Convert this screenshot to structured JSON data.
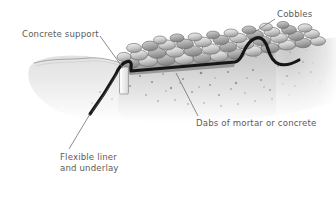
{
  "figure": {
    "type": "cross-section-illustration",
    "style": "pencil-and-wash grayscale technical illustration",
    "background_color": "#ffffff"
  },
  "labels": [
    {
      "id": "cobbles",
      "name": "label-cobbles",
      "text": "Cobbles",
      "lines": [
        "Cobbles"
      ],
      "x": 277,
      "y": 9,
      "color": "#5b5b5b",
      "leader": {
        "from": [
          275,
          19
        ],
        "to": [
          253,
          33
        ]
      }
    },
    {
      "id": "concrete-support",
      "name": "label-concrete-support",
      "text": "Concrete support",
      "lines": [
        "Concrete support"
      ],
      "x": 22,
      "y": 29,
      "color": "#5b5b5b",
      "leader": {
        "from": [
          100,
          36
        ],
        "to": [
          123,
          68
        ]
      }
    },
    {
      "id": "dabs",
      "name": "label-dabs-of-mortar-or-concrete",
      "text": "Dabs of mortar or concrete",
      "lines": [
        "Dabs of mortar or concrete"
      ],
      "x": 196,
      "y": 118,
      "color": "#5b5b5b",
      "leader": {
        "from": [
          198,
          117
        ],
        "to": [
          176,
          73
        ]
      }
    },
    {
      "id": "flexible-liner",
      "name": "label-flexible-liner-and-underlay",
      "text": "Flexible liner and underlay",
      "lines": [
        "Flexible liner",
        "and underlay"
      ],
      "x": 60,
      "y": 152,
      "color": "#5b5b5b",
      "leader": {
        "from": [
          69,
          150
        ],
        "to": [
          90,
          114
        ]
      }
    }
  ],
  "elements": {
    "ground_surface_line": {
      "name": "ground-surface-line",
      "color": "#9a9a9a"
    },
    "soil_mass": {
      "name": "soil-mass",
      "color_top": "#c9c9c9",
      "color_bottom": "#ffffff"
    },
    "soil_speckle": {
      "name": "soil-speckle-texture",
      "color": "#6e6e6e",
      "count": 150
    },
    "liner": {
      "name": "flexible-liner-membrane",
      "color": "#1a1a1a",
      "width_px": 3.2
    },
    "concrete_support_block": {
      "name": "concrete-support-block",
      "color": "#f2f2f2",
      "stroke": "#8a8a8a"
    },
    "mortar_bed": {
      "name": "mortar-dabs-bed",
      "color": "#8d8d8d"
    },
    "cobbles": {
      "name": "cobble-stones",
      "count": 46,
      "fill_light": "#efefef",
      "fill_mid": "#bdbdbd",
      "fill_dark": "#9a9a9a",
      "stroke": "#6a6a6a"
    }
  },
  "palette": {
    "text": "#5b5b5b",
    "leader_line": "#6d6d6d",
    "liner_black": "#1a1a1a",
    "soil_gray": "#c9c9c9",
    "stone_gray": "#bdbdbd",
    "white": "#ffffff"
  }
}
